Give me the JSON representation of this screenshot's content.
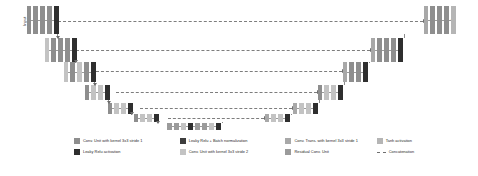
{
  "diagram": {
    "input_label": "Input",
    "output_label": "Output"
  },
  "palette": {
    "conv_k3_s1": "#8e8e8e",
    "leaky_relu": "#2f2f2f",
    "leaky_relu_bn": "#3d3d3d",
    "conv_k3_s2": "#c3c3c3",
    "conv_trans_k3_s1": "#a8a8a8",
    "residual_conv": "#9b9b9b",
    "tanh": "#b5b5b5",
    "concat_line": "#7d7d7d"
  },
  "legend": {
    "rows": [
      [
        {
          "label": "Conv. Unit with kernel 3x3  stride 1",
          "swatch": "#8e8e8e",
          "kind": "swatch"
        },
        {
          "label": "Leaky Relu + Batch normalization",
          "swatch": "#3d3d3d",
          "kind": "swatch"
        },
        {
          "label": "Conv. Trans. with kernel 3x3  stride 1",
          "swatch": "#a8a8a8",
          "kind": "swatch"
        },
        {
          "label": "Tanh activation",
          "swatch": "#b5b5b5",
          "kind": "swatch"
        }
      ],
      [
        {
          "label": "Leaky Relu activation",
          "swatch": "#2f2f2f",
          "kind": "swatch"
        },
        {
          "label": "Conv. Unit with kernel 3x3  stride 2",
          "swatch": "#c3c3c3",
          "kind": "swatch"
        },
        {
          "label": "Residual Conv. Unit",
          "swatch": "#9b9b9b",
          "kind": "swatch"
        },
        {
          "label": "Concatenation",
          "swatch": "#7d7d7d",
          "kind": "dash"
        }
      ]
    ]
  },
  "encoder_levels": [
    {
      "name": "enc-level-1",
      "left": 27,
      "top": 6,
      "bar_h": 28,
      "blocks": [
        {
          "w": 4,
          "c": "#8e8e8e"
        },
        {
          "w": 5,
          "c": "#8e8e8e"
        },
        {
          "w": 5,
          "c": "#8e8e8e"
        },
        {
          "w": 5,
          "c": "#8e8e8e"
        },
        {
          "w": 5,
          "c": "#2f2f2f"
        }
      ]
    },
    {
      "name": "enc-level-2",
      "left": 45,
      "top": 38,
      "bar_h": 24,
      "blocks": [
        {
          "w": 4,
          "c": "#c3c3c3"
        },
        {
          "w": 5,
          "c": "#8e8e8e"
        },
        {
          "w": 5,
          "c": "#8e8e8e"
        },
        {
          "w": 5,
          "c": "#8e8e8e"
        },
        {
          "w": 5,
          "c": "#2f2f2f"
        }
      ]
    },
    {
      "name": "enc-level-3",
      "left": 64,
      "top": 62,
      "bar_h": 20,
      "blocks": [
        {
          "w": 4,
          "c": "#c3c3c3"
        },
        {
          "w": 5,
          "c": "#8e8e8e"
        },
        {
          "w": 5,
          "c": "#c3c3c3"
        },
        {
          "w": 5,
          "c": "#8e8e8e"
        },
        {
          "w": 5,
          "c": "#2f2f2f"
        }
      ]
    },
    {
      "name": "enc-level-4",
      "left": 85,
      "top": 85,
      "bar_h": 15,
      "blocks": [
        {
          "w": 4,
          "c": "#8e8e8e"
        },
        {
          "w": 5,
          "c": "#c3c3c3"
        },
        {
          "w": 5,
          "c": "#c3c3c3"
        },
        {
          "w": 5,
          "c": "#2f2f2f"
        }
      ]
    },
    {
      "name": "enc-level-5",
      "left": 108,
      "top": 103,
      "bar_h": 11,
      "blocks": [
        {
          "w": 4,
          "c": "#8e8e8e"
        },
        {
          "w": 5,
          "c": "#c3c3c3"
        },
        {
          "w": 5,
          "c": "#c3c3c3"
        },
        {
          "w": 5,
          "c": "#2f2f2f"
        }
      ]
    },
    {
      "name": "enc-level-6",
      "left": 134,
      "top": 114,
      "bar_h": 8,
      "blocks": [
        {
          "w": 4,
          "c": "#8e8e8e"
        },
        {
          "w": 5,
          "c": "#c3c3c3"
        },
        {
          "w": 5,
          "c": "#c3c3c3"
        },
        {
          "w": 5,
          "c": "#2f2f2f"
        }
      ]
    }
  ],
  "bottleneck": {
    "name": "bottleneck-level",
    "left": 167,
    "top": 123,
    "bar_h": 7,
    "blocks": [
      {
        "w": 5,
        "c": "#9b9b9b"
      },
      {
        "w": 5,
        "c": "#9b9b9b"
      },
      {
        "w": 5,
        "c": "#c3c3c3"
      },
      {
        "w": 5,
        "c": "#2f2f2f"
      },
      {
        "w": 5,
        "c": "#9b9b9b"
      },
      {
        "w": 5,
        "c": "#9b9b9b"
      },
      {
        "w": 5,
        "c": "#c3c3c3"
      },
      {
        "w": 5,
        "c": "#2f2f2f"
      }
    ]
  },
  "decoder_levels": [
    {
      "name": "dec-level-6",
      "left": 265,
      "top": 114,
      "bar_h": 8,
      "blocks": [
        {
          "w": 4,
          "c": "#a8a8a8"
        },
        {
          "w": 5,
          "c": "#c3c3c3"
        },
        {
          "w": 5,
          "c": "#c3c3c3"
        },
        {
          "w": 5,
          "c": "#2f2f2f"
        }
      ]
    },
    {
      "name": "dec-level-5",
      "left": 293,
      "top": 103,
      "bar_h": 11,
      "blocks": [
        {
          "w": 4,
          "c": "#a8a8a8"
        },
        {
          "w": 5,
          "c": "#c3c3c3"
        },
        {
          "w": 5,
          "c": "#c3c3c3"
        },
        {
          "w": 5,
          "c": "#2f2f2f"
        }
      ]
    },
    {
      "name": "dec-level-4",
      "left": 318,
      "top": 85,
      "bar_h": 15,
      "blocks": [
        {
          "w": 4,
          "c": "#8e8e8e"
        },
        {
          "w": 5,
          "c": "#c3c3c3"
        },
        {
          "w": 5,
          "c": "#c3c3c3"
        },
        {
          "w": 5,
          "c": "#2f2f2f"
        }
      ]
    },
    {
      "name": "dec-level-3",
      "left": 343,
      "top": 62,
      "bar_h": 20,
      "blocks": [
        {
          "w": 4,
          "c": "#a8a8a8"
        },
        {
          "w": 5,
          "c": "#8e8e8e"
        },
        {
          "w": 5,
          "c": "#8e8e8e"
        },
        {
          "w": 5,
          "c": "#2f2f2f"
        }
      ]
    },
    {
      "name": "dec-level-2",
      "left": 371,
      "top": 38,
      "bar_h": 24,
      "blocks": [
        {
          "w": 4,
          "c": "#a8a8a8"
        },
        {
          "w": 5,
          "c": "#8e8e8e"
        },
        {
          "w": 5,
          "c": "#8e8e8e"
        },
        {
          "w": 5,
          "c": "#8e8e8e"
        },
        {
          "w": 5,
          "c": "#2f2f2f"
        }
      ]
    },
    {
      "name": "dec-level-1",
      "left": 424,
      "top": 6,
      "bar_h": 28,
      "blocks": [
        {
          "w": 4,
          "c": "#a8a8a8"
        },
        {
          "w": 5,
          "c": "#8e8e8e"
        },
        {
          "w": 5,
          "c": "#8e8e8e"
        },
        {
          "w": 5,
          "c": "#8e8e8e"
        },
        {
          "w": 5,
          "c": "#b5b5b5"
        }
      ]
    }
  ],
  "skip_connections": [
    {
      "name": "skip-level-1",
      "left": 58,
      "top": 21,
      "width": 365
    },
    {
      "name": "skip-level-2",
      "left": 76,
      "top": 50,
      "width": 294
    },
    {
      "name": "skip-level-3",
      "left": 96,
      "top": 71,
      "width": 246
    },
    {
      "name": "skip-level-4",
      "left": 116,
      "top": 92,
      "width": 201
    },
    {
      "name": "skip-level-5",
      "left": 140,
      "top": 108,
      "width": 152
    },
    {
      "name": "skip-level-6",
      "left": 168,
      "top": 118,
      "width": 96
    }
  ]
}
